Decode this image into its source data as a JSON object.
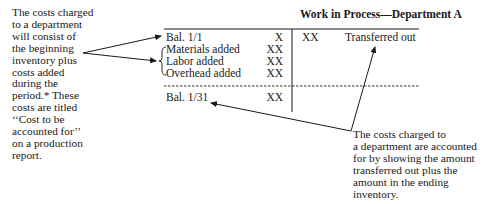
{
  "account": {
    "title": "Work in Process—Department A",
    "debit_rows": [
      {
        "label": "Bal. 1/1",
        "amount": "X"
      },
      {
        "label": "Materials added",
        "amount": "XX"
      },
      {
        "label": "Labor added",
        "amount": "XX"
      },
      {
        "label": "Overhead added",
        "amount": "XX"
      }
    ],
    "ending_row": {
      "label": "Bal. 1/31",
      "amount": "XX"
    },
    "credit_row": {
      "amount": "XX",
      "label": "Transferred out"
    }
  },
  "notes": {
    "left": "The costs charged\nto a department\nwill consist of\nthe beginning\ninventory plus\ncosts added\nduring the\nperiod.* These\ncosts are titled\n‘‘Cost to be\naccounted for’’\non a production\nreport.",
    "right": "The costs charged to\na department are accounted\nfor by showing the amount\ntransferred out plus the\namount in the ending\ninventory."
  }
}
